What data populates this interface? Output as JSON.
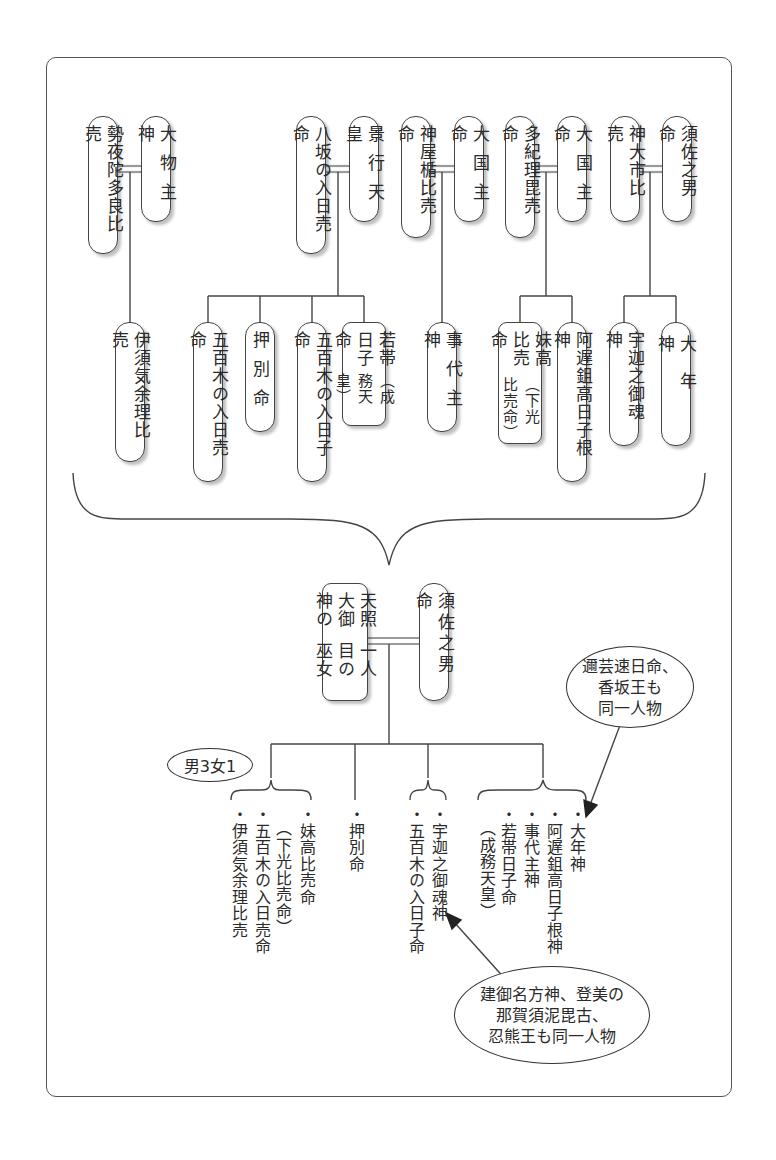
{
  "diagram": {
    "type": "family-tree",
    "top_couples": [
      {
        "id": "c1",
        "husband": "大物主神",
        "wife": "勢夜陀多良比売",
        "children": [
          "伊須気余理比売"
        ]
      },
      {
        "id": "c2",
        "husband": "景行天皇",
        "wife": "八坂の入日売命",
        "children": [
          "五百木の入日売命",
          "押別命",
          "五百木の入日子命",
          "若帯日子命（成務天皇）"
        ]
      },
      {
        "id": "c3",
        "husband": "大国主命",
        "wife": "神屋楯比売命",
        "children": [
          "事代主神"
        ]
      },
      {
        "id": "c4",
        "husband": "大国主命",
        "wife": "多紀理毘売命",
        "children": [
          "妹高比売命（下光比売命）",
          "阿遅鉏高日子根神"
        ]
      },
      {
        "id": "c5",
        "husband": "須佐之男命",
        "wife": "神大市比売",
        "children": [
          "宇迦之御魂神",
          "大年神"
        ]
      }
    ],
    "bottom_couple": {
      "husband": "須佐之男命",
      "wife": "天照大御神の一人目の巫女"
    },
    "count_label": "男3女1",
    "bottom_groups": [
      {
        "items": [
          "妹高比売命（下光比売命）",
          "五百木の入日売命",
          "伊須気余理比売"
        ]
      },
      {
        "items": [
          "押別命"
        ]
      },
      {
        "items": [
          "宇迦之御魂神",
          "五百木の入日子命"
        ]
      },
      {
        "items": [
          "大年神",
          "阿遅鉏高日子根神",
          "事代主神",
          "若帯日子命（成務天皇）"
        ]
      }
    ],
    "notes": [
      {
        "target": "大年神",
        "lines": [
          "邇芸速日命、",
          "香坂王も",
          "同一人物"
        ]
      },
      {
        "target": "宇迦之御魂神",
        "lines": [
          "建御名方神、登美の",
          "那賀須泥毘古、",
          "忍熊王も同一人物"
        ]
      }
    ]
  },
  "labels": {
    "c1_h": "大物主神",
    "c1_w": "勢夜陀多良比売",
    "c1_k1": "伊須気余理比売",
    "c2_h": "景行天皇",
    "c2_w": "八坂の入日売命",
    "c2_k1": "五百木の入日売命",
    "c2_k2": "押別命",
    "c2_k3": "五百木の入日子命",
    "c2_k4a": "若帯日子命",
    "c2_k4b": "（成務天皇）",
    "c3_h": "大国主命",
    "c3_w": "神屋楯比売命",
    "c3_k1": "事代主神",
    "c4_h": "大国主命",
    "c4_w": "多紀理毘売命",
    "c4_k1a": "妹高比売命",
    "c4_k1b": "（下光比売命）",
    "c4_k2": "阿遅鉏高日子根神",
    "c5_h": "須佐之男命",
    "c5_w": "神大市比売",
    "c5_k1": "宇迦之御魂神",
    "c5_k2": "大年神",
    "b_h": "須佐之男命",
    "b_w1": "天照大御神の",
    "b_w2": "一人目の巫女",
    "count": "男3女1",
    "g1_1": "・妹高比売命",
    "g1_1b": "（下光比売命）",
    "g1_2": "・五百木の入日売命",
    "g1_3": "・伊須気余理比売",
    "g2_1": "・押別命",
    "g3_1": "・宇迦之御魂神",
    "g3_2": "・五百木の入日子命",
    "g4_1": "・大年神",
    "g4_2": "・阿遅鉏高日子根神",
    "g4_3": "・事代主神",
    "g4_4": "・若帯日子命",
    "g4_4b": "（成務天皇）",
    "note1_l1": "邇芸速日命、",
    "note1_l2": "香坂王も",
    "note1_l3": "同一人物",
    "note2_l1": "建御名方神、登美の",
    "note2_l2": "那賀須泥毘古、",
    "note2_l3": "忍熊王も同一人物"
  },
  "colors": {
    "line": "#444444",
    "marriage_line": "#9a9a9a",
    "frame": "#555555",
    "text": "#2a2a2a"
  }
}
